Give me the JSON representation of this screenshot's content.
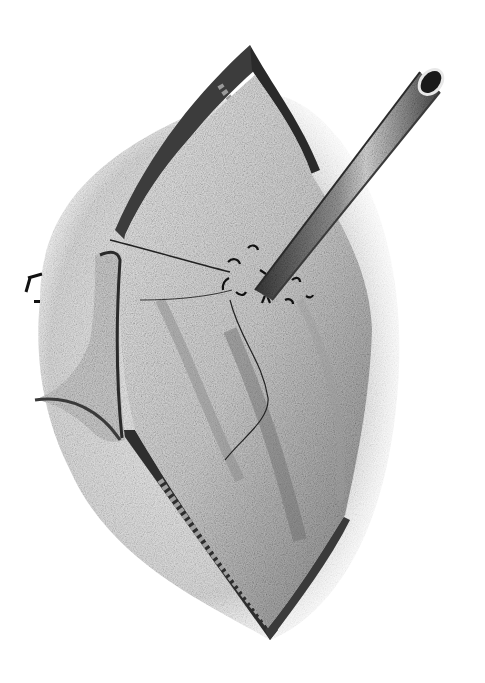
{
  "image": {
    "kind": "surgical-illustration",
    "description": "Grayscale pencil illustration of an open surgical incision with a tube (catheter) inserted through a purse-string sutured organ wall",
    "palette": {
      "background": "#ffffff",
      "dark": "#1e1e1e",
      "mid": "#7a7a7a",
      "light": "#d6d6d6"
    }
  }
}
